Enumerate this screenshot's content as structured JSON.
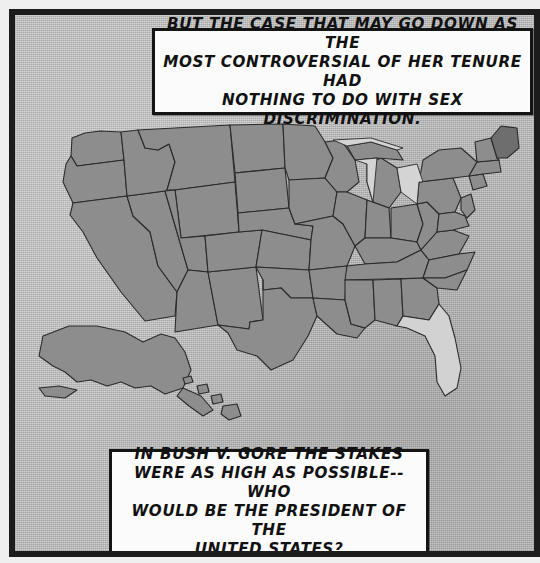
{
  "panel": {
    "border_color": "#1c1c1c",
    "background_color": "#c6c6c6"
  },
  "captions": {
    "top": {
      "name": "top-caption",
      "text": "But the case that may go down as the\nmost controversial of her tenure had\nnothing to do with sex discrimination."
    },
    "bottom": {
      "name": "bottom-caption",
      "text": "In Bush v. Gore the stakes\nwere as high as possible--who\nwould be the president of the\nUnited States?"
    }
  },
  "map": {
    "name": "united-states-map",
    "shaded_state_color": "#8d8d8d",
    "unshaded_state_color": "#d2d2d2",
    "outline_color": "#2a2a2a",
    "highlighted_unshaded_states": [
      "Florida"
    ],
    "includes_insets": [
      "Alaska",
      "Hawaii"
    ],
    "water_features": [
      "Lake Michigan",
      "Lake Superior",
      "Lake Huron",
      "Lake Erie",
      "Lake Ontario"
    ]
  }
}
